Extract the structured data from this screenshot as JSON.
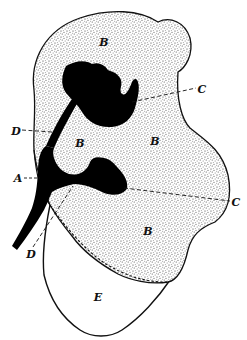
{
  "figure": {
    "kind": "anatomical line drawing (stippled section)",
    "colors": {
      "background": "#ffffff",
      "stipple": "#2a2a2a",
      "solid": "#000000",
      "outline": "#111111"
    },
    "labels": [
      {
        "id": "B-top",
        "text": "B",
        "x": 104,
        "y": 42
      },
      {
        "id": "C-top",
        "text": "C",
        "x": 202,
        "y": 89
      },
      {
        "id": "D-top",
        "text": "D",
        "x": 16,
        "y": 131
      },
      {
        "id": "B-mid-left",
        "text": "B",
        "x": 80,
        "y": 143
      },
      {
        "id": "B-mid-right",
        "text": "B",
        "x": 155,
        "y": 141
      },
      {
        "id": "A",
        "text": "A",
        "x": 18,
        "y": 178
      },
      {
        "id": "C-bottom",
        "text": "C",
        "x": 236,
        "y": 202
      },
      {
        "id": "B-lower",
        "text": "B",
        "x": 148,
        "y": 231
      },
      {
        "id": "D-bottom",
        "text": "D",
        "x": 31,
        "y": 254
      },
      {
        "id": "E",
        "text": "E",
        "x": 98,
        "y": 297
      }
    ]
  }
}
